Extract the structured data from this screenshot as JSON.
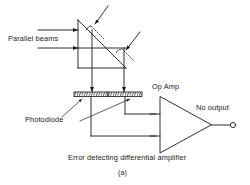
{
  "figure": {
    "caption": "(a)",
    "labels": {
      "parallel_beams": "Parallel beams",
      "photodiode": "Photodiode",
      "op_amp": "Op Amp",
      "no_output": "No output",
      "error_amp": "Error detecting differential amplifier"
    },
    "colors": {
      "ink": "#1a1a1a",
      "background": "#ffffff"
    },
    "components": {
      "prism": "right-triangle-prism",
      "beam_count": 2,
      "photodiode_count": 2,
      "amplifier": "differential-op-amp",
      "output_terminal": "open-circle"
    }
  }
}
